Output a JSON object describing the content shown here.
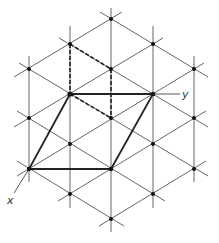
{
  "diagram": {
    "colors": {
      "grid": "#555555",
      "bold": "#222222",
      "point": "#111111",
      "label": "#333333"
    },
    "axes": {
      "x_label": "x",
      "y_label": "y"
    },
    "vertical_lines_x": [
      29,
      70,
      111,
      153,
      194
    ],
    "lattice_points": [
      [
        111,
        19
      ],
      [
        70,
        44
      ],
      [
        153,
        44
      ],
      [
        29,
        69
      ],
      [
        111,
        69
      ],
      [
        194,
        69
      ],
      [
        70,
        94
      ],
      [
        153,
        94
      ],
      [
        29,
        118
      ],
      [
        111,
        118
      ],
      [
        194,
        118
      ],
      [
        70,
        144
      ],
      [
        153,
        144
      ],
      [
        29,
        169
      ],
      [
        111,
        169
      ],
      [
        194,
        169
      ],
      [
        70,
        194
      ],
      [
        153,
        194
      ],
      [
        111,
        219
      ]
    ],
    "unit_cell": {
      "description": "bold parallelogram",
      "vertices": [
        [
          70,
          94
        ],
        [
          153,
          94
        ],
        [
          111,
          169
        ],
        [
          29,
          169
        ]
      ]
    },
    "dashed_cell": {
      "description": "dashed parallelogram (hexagonal subcell)",
      "vertices": [
        [
          70,
          44
        ],
        [
          111,
          69
        ],
        [
          111,
          118
        ],
        [
          70,
          94
        ]
      ]
    }
  }
}
